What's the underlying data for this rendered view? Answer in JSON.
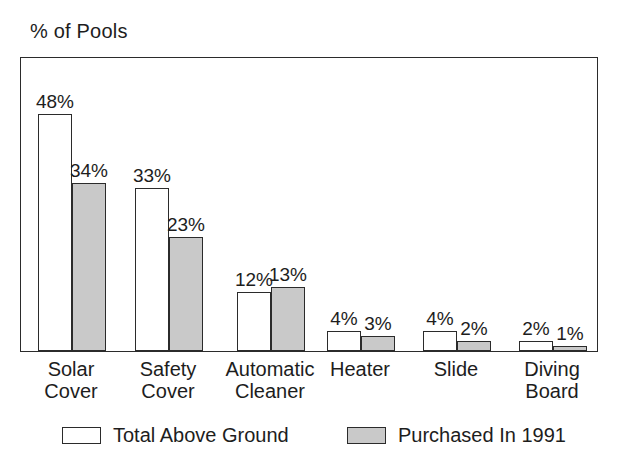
{
  "chart_data": {
    "type": "bar",
    "title": "",
    "ylabel": "% of Pools",
    "xlabel": "",
    "ylim": [
      0,
      60
    ],
    "grid": false,
    "legend_position": "bottom",
    "categories": [
      "Solar\nCover",
      "Safety\nCover",
      "Automatic\nCleaner",
      "Heater",
      "Slide",
      "Diving\nBoard"
    ],
    "series": [
      {
        "name": "Total Above Ground",
        "color": "#ffffff",
        "values": [
          48,
          33,
          12,
          4,
          4,
          2
        ],
        "labels": [
          "48%",
          "33%",
          "12%",
          "4%",
          "4%",
          "2%"
        ]
      },
      {
        "name": "Purchased In 1991",
        "color": "#c9c9c9",
        "values": [
          34,
          23,
          13,
          3,
          2,
          1
        ],
        "labels": [
          "34%",
          "23%",
          "13%",
          "3%",
          "2%",
          "1%"
        ]
      }
    ]
  },
  "axis": {
    "y_caption": "% of Pools"
  },
  "legend": {
    "items": [
      {
        "label": "Total Above Ground",
        "swatch": "white-square-outline"
      },
      {
        "label": "Purchased In 1991",
        "swatch": "gray-filled-square"
      }
    ]
  }
}
